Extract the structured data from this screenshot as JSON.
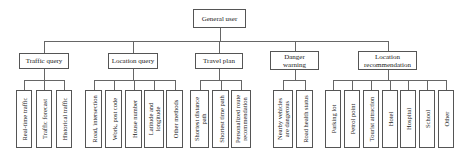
{
  "root": {
    "label": "General user",
    "x": 193,
    "y": 9,
    "w": 53,
    "h": 19
  },
  "bus_y": 41,
  "categories": [
    {
      "label": "Traffic query",
      "x": 19,
      "y": 53,
      "w": 50,
      "h": 16,
      "leaves": [
        {
          "label": "Real-time traffic",
          "x": 16,
          "w": 16
        },
        {
          "label": "Traffic forecast",
          "x": 36,
          "w": 16
        },
        {
          "label": "Historical traffic",
          "x": 56,
          "w": 16
        }
      ]
    },
    {
      "label": "Location query",
      "x": 108,
      "y": 53,
      "w": 50,
      "h": 16,
      "leaves": [
        {
          "label": "Road, intersection",
          "x": 85,
          "w": 17
        },
        {
          "label": "Work, post code",
          "x": 105,
          "w": 17
        },
        {
          "label": "House number",
          "x": 125,
          "w": 17
        },
        {
          "label": "Latitude and\nlongitude",
          "x": 144,
          "w": 20
        },
        {
          "label": "Other methods",
          "x": 166,
          "w": 17
        }
      ]
    },
    {
      "label": "Travel plan",
      "x": 195,
      "y": 53,
      "w": 48,
      "h": 16,
      "leaves": [
        {
          "label": "Shortest distance\npath",
          "x": 190,
          "w": 19
        },
        {
          "label": "Shortest time path",
          "x": 212,
          "w": 17
        },
        {
          "label": "Personalized route\nrecommendation",
          "x": 231,
          "w": 20
        }
      ]
    },
    {
      "label": "Danger\nwarning",
      "x": 270,
      "y": 51,
      "w": 49,
      "h": 19,
      "leaves": [
        {
          "label": "Nearby vehicles\nare dangerous",
          "x": 273,
          "w": 20
        },
        {
          "label": "Road health status",
          "x": 296,
          "w": 17
        }
      ]
    },
    {
      "label": "Location\nrecommendation",
      "x": 358,
      "y": 51,
      "w": 59,
      "h": 19,
      "leaves": [
        {
          "label": "Parking lot",
          "x": 325,
          "w": 16
        },
        {
          "label": "Petrol point",
          "x": 344,
          "w": 16
        },
        {
          "label": "Tourist attraction",
          "x": 363,
          "w": 16
        },
        {
          "label": "Hotel",
          "x": 382,
          "w": 16
        },
        {
          "label": "Hospital",
          "x": 400,
          "w": 16
        },
        {
          "label": "School",
          "x": 419,
          "w": 16
        },
        {
          "label": "Other",
          "x": 438,
          "w": 16
        }
      ]
    }
  ],
  "leaf_y": 90,
  "leaf_h": 58,
  "leaf_bus_offset": 10
}
